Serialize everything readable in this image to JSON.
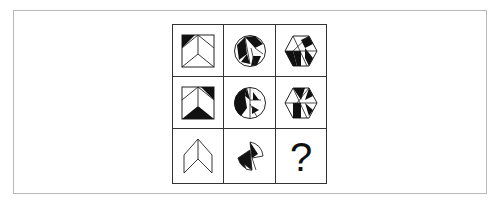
{
  "puzzle": {
    "type": "3x3 figure reasoning matrix",
    "missing_cell_label": "?",
    "rows": [
      [
        {
          "shape": "square-chevron",
          "description": "square with chevron lines, top-left corner triangle black"
        },
        {
          "shape": "circle-segments",
          "description": "circle with black and white segmented triangles"
        },
        {
          "shape": "hexagon-segments",
          "description": "hexagon with black and white triangle segments"
        }
      ],
      [
        {
          "shape": "square-chevron",
          "description": "square with chevron, top-right triangle and bottom chevron region black"
        },
        {
          "shape": "circle-segments",
          "description": "circle with left half mostly black, segmented triangles"
        },
        {
          "shape": "hexagon-segments",
          "description": "hexagon with black triangle segments and white regions"
        }
      ],
      [
        {
          "shape": "chevron-outline",
          "description": "white chevron outline"
        },
        {
          "shape": "circle-fragments",
          "description": "two circle-arc fragments with black regions"
        },
        {
          "shape": "question",
          "description": "unknown"
        }
      ]
    ]
  },
  "colors": {
    "stroke": "#222222",
    "fill_black": "#111111",
    "frame": "#b8b8b8",
    "background": "#ffffff"
  }
}
